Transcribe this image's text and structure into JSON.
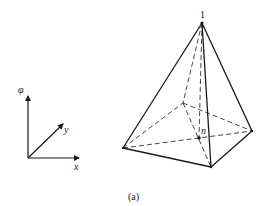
{
  "figure": {
    "caption": "(a)",
    "colors": {
      "line": "#1a1a1a",
      "background": "#ffffff"
    }
  },
  "axes": {
    "labels": {
      "vertical": "φ",
      "x": "x",
      "y": "y"
    }
  },
  "pyramid": {
    "apex_label": "1",
    "interior_point_label": "n",
    "vertices": {
      "apex": [
        202,
        23
      ],
      "base_left": [
        123,
        148
      ],
      "base_front": [
        211,
        167
      ],
      "base_right": [
        252,
        131
      ],
      "base_back": [
        183,
        103
      ],
      "interior_n": [
        199,
        138
      ]
    },
    "visible_edges": [
      [
        "apex",
        "base_left"
      ],
      [
        "apex",
        "base_front"
      ],
      [
        "apex",
        "base_right"
      ],
      [
        "base_left",
        "base_front"
      ],
      [
        "base_front",
        "base_right"
      ]
    ],
    "hidden_edges": [
      [
        "apex",
        "base_back"
      ],
      [
        "base_left",
        "base_back"
      ],
      [
        "base_back",
        "base_right"
      ],
      [
        "apex",
        "interior_n"
      ],
      [
        "base_left",
        "base_right"
      ],
      [
        "base_back",
        "base_front"
      ]
    ]
  }
}
